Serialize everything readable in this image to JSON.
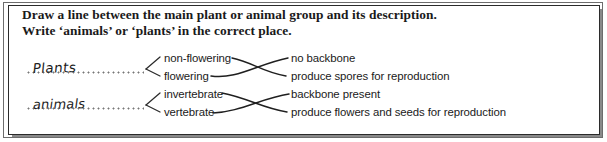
{
  "worksheet": {
    "instructions": [
      "Draw a line between the main plant or animal group and its description.",
      "Write ‘animals’ or ‘plants’ in the correct place."
    ],
    "answer_blanks": [
      {
        "handwritten_value": "Plants",
        "blank_style": "dotted-line"
      },
      {
        "handwritten_value": "animals",
        "blank_style": "dotted-line"
      }
    ],
    "group_labels": [
      "non-flowering",
      "flowering",
      "invertebrate",
      "vertebrate"
    ],
    "descriptions": [
      "no backbone",
      "produce spores for reproduction",
      "backbone present",
      "produce flowers and seeds for reproduction"
    ],
    "bracket_links": [
      {
        "from_blank": 0,
        "to_groups": [
          0,
          1
        ]
      },
      {
        "from_blank": 1,
        "to_groups": [
          2,
          3
        ]
      }
    ],
    "matching_lines": [
      {
        "from_group": "non-flowering",
        "to_description": "produce spores for reproduction"
      },
      {
        "from_group": "flowering",
        "to_description": "no backbone"
      },
      {
        "from_group": "invertebrate",
        "to_description": "produce flowers and seeds for reproduction"
      },
      {
        "from_group": "vertebrate",
        "to_description": "backbone present"
      }
    ],
    "colors": {
      "ink": "#1a1a1a",
      "pencil": "#3a3a3a",
      "frame_outer": "#6d6d6d",
      "frame_inner": "#2b2b2b",
      "shadow": "#8a8a8a",
      "paper": "#ffffff",
      "dots": "#777777"
    }
  }
}
